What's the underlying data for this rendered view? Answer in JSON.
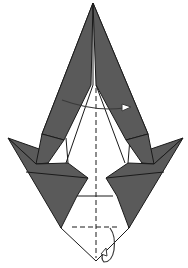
{
  "diagram": {
    "type": "origami-fold-step",
    "colors": {
      "paper_colored_side": "#5a5a5a",
      "paper_white_side": "#ffffff",
      "line": "#1a1a1a",
      "arrow": "#3a3a3a"
    },
    "symbols": [
      {
        "name": "valley-fold-vertical",
        "style": "dashed",
        "orientation": "vertical centerline"
      },
      {
        "name": "valley-fold-horizontal",
        "style": "dashed",
        "orientation": "horizontal near bottom"
      },
      {
        "name": "fold-over-arrow",
        "style": "curved arrow with open head",
        "direction": "left-to-right"
      },
      {
        "name": "fold-behind-arrow",
        "style": "curved loop arrow",
        "direction": "down and behind"
      }
    ],
    "labels": []
  }
}
